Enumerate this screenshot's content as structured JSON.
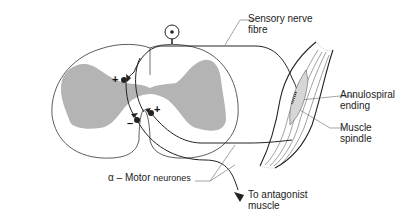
{
  "diagram": {
    "type": "reflex arc (stretch reflex)",
    "labels": {
      "sensory_nerve_line1": "Sensory nerve",
      "sensory_nerve_line2": "fibre",
      "annulospiral_line1": "Annulospiral",
      "annulospiral_line2": "ending",
      "spindle_line1": "Muscle",
      "spindle_line2": "spindle",
      "motor_alpha": "α – Motor",
      "motor_neurones": "neurones",
      "antagonist_line1": "To antagonist",
      "antagonist_line2": "muscle"
    },
    "signs": {
      "plus_upper": "+",
      "plus_right": "+",
      "minus": "–"
    },
    "colors": {
      "grey_matter": "#b4b4b4",
      "line": "#222222",
      "spindle": "#d6d6d6"
    }
  }
}
